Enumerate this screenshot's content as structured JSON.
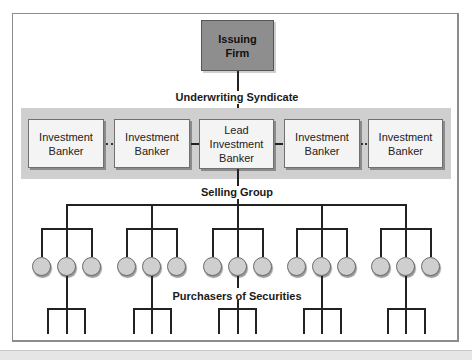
{
  "diagram": {
    "top_node": {
      "label": "Issuing Firm",
      "line1": "Issuing",
      "line2": "Firm",
      "color": "#8e8e8e"
    },
    "syndicate_label": "Underwriting Syndicate",
    "bankers": [
      {
        "line1": "Investment",
        "line2": "Banker",
        "line3": "",
        "link_to_next": "dotted"
      },
      {
        "line1": "Investment",
        "line2": "Banker",
        "line3": "",
        "link_to_next": "solid"
      },
      {
        "line1": "Lead",
        "line2": "Investment",
        "line3": "Banker",
        "link_to_next": "solid"
      },
      {
        "line1": "Investment",
        "line2": "Banker",
        "line3": "",
        "link_to_next": "dotted"
      },
      {
        "line1": "Investment",
        "line2": "Banker",
        "line3": ""
      }
    ],
    "selling_group_label": "Selling Group",
    "selling_groups": [
      {
        "members": 3
      },
      {
        "members": 3
      },
      {
        "members": 3
      },
      {
        "members": 3
      },
      {
        "members": 3
      }
    ],
    "purchasers_label": "Purchasers of Securities",
    "purchaser_branches": [
      {
        "legs": 3
      },
      {
        "legs": 3
      },
      {
        "legs": 3
      },
      {
        "legs": 3
      },
      {
        "legs": 3
      }
    ],
    "band_color": "#cfcfcf"
  }
}
